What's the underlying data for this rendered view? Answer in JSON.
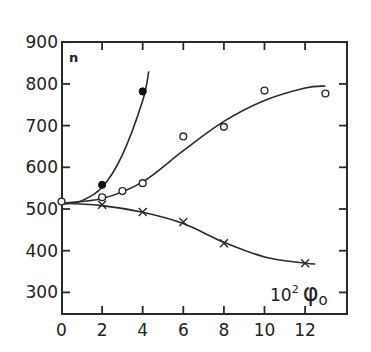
{
  "chart_data": {
    "type": "scatter",
    "title": "",
    "xlabel": "10² φ₀",
    "ylabel": "n",
    "xlim": [
      0,
      14
    ],
    "ylim": [
      250,
      900
    ],
    "x_ticks": [
      0,
      2,
      4,
      6,
      8,
      10,
      12
    ],
    "y_ticks": [
      300,
      400,
      500,
      600,
      700,
      800,
      900
    ],
    "grid": false,
    "legend": null,
    "series": [
      {
        "name": "filled circles",
        "marker": "filled-circle",
        "line": "smooth-curve",
        "points": [
          [
            0,
            515
          ],
          [
            2,
            558
          ],
          [
            4,
            782
          ]
        ]
      },
      {
        "name": "open circles",
        "marker": "open-circle",
        "line": "smooth-curve",
        "points": [
          [
            0,
            518
          ],
          [
            2,
            528
          ],
          [
            3,
            543
          ],
          [
            4,
            562
          ],
          [
            6,
            674
          ],
          [
            8,
            697
          ],
          [
            10,
            784
          ],
          [
            13,
            777
          ]
        ]
      },
      {
        "name": "crosses",
        "marker": "cross",
        "line": "smooth-curve",
        "points": [
          [
            2,
            510
          ],
          [
            4,
            493
          ],
          [
            6,
            469
          ],
          [
            8,
            418
          ],
          [
            12,
            370
          ]
        ]
      }
    ]
  },
  "labels": {
    "y_var": "n",
    "x_label_base": "10",
    "x_label_exp": "2",
    "x_label_sym": "φ",
    "x_label_sub": "o"
  }
}
